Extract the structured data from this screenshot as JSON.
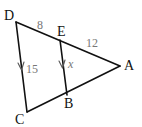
{
  "figure": {
    "type": "triangle-with-parallel-segment",
    "points": {
      "D": {
        "label": "D",
        "x": 16,
        "y": 22
      },
      "E": {
        "label": "E",
        "x": 60,
        "y": 40
      },
      "A": {
        "label": "A",
        "x": 120,
        "y": 66
      },
      "B": {
        "label": "B",
        "x": 67,
        "y": 95
      },
      "C": {
        "label": "C",
        "x": 27,
        "y": 112
      }
    },
    "segments": [
      {
        "from": "D",
        "to": "A"
      },
      {
        "from": "A",
        "to": "C"
      },
      {
        "from": "C",
        "to": "D"
      },
      {
        "from": "E",
        "to": "B"
      }
    ],
    "measurements": {
      "DE": "8",
      "EA": "12",
      "DC": "15",
      "EB": "x"
    },
    "parallel_marks": [
      "DC",
      "EB"
    ],
    "colors": {
      "line": "#111111",
      "measure_text": "#777777",
      "point_text": "#111111"
    }
  }
}
